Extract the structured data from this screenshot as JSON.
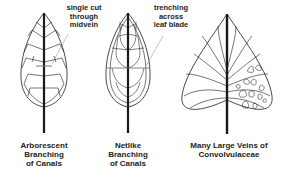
{
  "figure": {
    "leaves": [
      {
        "id": "arborescent",
        "caption": "Arborescent\nBranching\nof Canals",
        "annotation": "single cut\nthrough\nmidvein"
      },
      {
        "id": "netlike",
        "caption": "Netlike\nBranching\nof Canals",
        "annotation": "trenching\nacross\nleaf blade"
      },
      {
        "id": "convolvulaceae",
        "caption": "Many Large Veins of\nConvolvulaceae"
      }
    ]
  },
  "colors": {
    "stroke": "#1a1a1a",
    "background": "#ffffff"
  }
}
